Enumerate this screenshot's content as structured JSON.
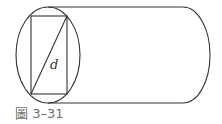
{
  "figure": {
    "label_d": "d",
    "caption": "圖 3–31",
    "stroke_color": "#333333",
    "caption_color": "#6f6f6f"
  },
  "geometry": {
    "ellipse": {
      "cx": 48,
      "cy": 55,
      "rx": 32,
      "ry": 48
    },
    "rectangle": {
      "x": 31,
      "y": 16,
      "width": 36,
      "height": 78
    },
    "diagonal": {
      "x1": 31,
      "y1": 94,
      "x2": 67,
      "y2": 16
    },
    "cylinder_top_y": 7,
    "cylinder_bottom_y": 103,
    "cylinder_right_x": 183,
    "cylinder_cap_rx": 27
  }
}
